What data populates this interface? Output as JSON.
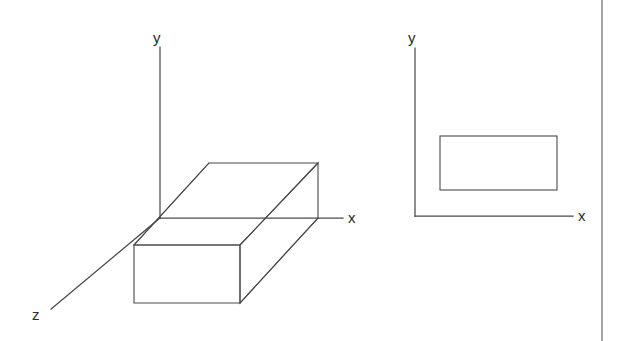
{
  "figure": {
    "background_color": "#ffffff",
    "line_color": "#4a4a4a",
    "label_color": "#2b2b2b",
    "width": 625,
    "height": 341
  },
  "left_diagram": {
    "name": "three-dimensional-box",
    "axes": [
      {
        "id": "y",
        "label": "y",
        "label_x": 153,
        "label_y": 43,
        "x1": 160,
        "y1": 47,
        "x2": 160,
        "y2": 218
      },
      {
        "id": "x",
        "label": "x",
        "label_x": 348,
        "label_y": 223,
        "x1": 160,
        "y1": 218,
        "x2": 343,
        "y2": 218
      },
      {
        "id": "z",
        "label": "z",
        "label_x": 32,
        "label_y": 320,
        "x1": 160,
        "y1": 218,
        "x2": 51,
        "y2": 309
      }
    ],
    "box": {
      "top_face": [
        [
          209,
          163
        ],
        [
          318,
          163
        ],
        [
          240,
          245
        ],
        [
          134,
          245
        ]
      ],
      "front_face": [
        [
          134,
          245
        ],
        [
          240,
          245
        ],
        [
          240,
          303
        ],
        [
          134,
          303
        ]
      ],
      "right_face": [
        [
          240,
          245
        ],
        [
          318,
          163
        ],
        [
          318,
          218
        ],
        [
          240,
          303
        ]
      ],
      "vertices": {
        "top_back_left": [
          209,
          163
        ],
        "top_back_right": [
          318,
          163
        ],
        "top_front_right": [
          240,
          245
        ],
        "top_front_left": [
          134,
          245
        ],
        "bottom_front_left": [
          134,
          303
        ],
        "bottom_front_right": [
          240,
          303
        ],
        "bottom_back_right": [
          318,
          218
        ]
      }
    }
  },
  "right_diagram": {
    "name": "two-dimensional-projection",
    "axes": [
      {
        "id": "y",
        "label": "y",
        "label_x": 408,
        "label_y": 43,
        "x1": 415,
        "y1": 48,
        "x2": 415,
        "y2": 216
      },
      {
        "id": "x",
        "label": "x",
        "label_x": 578,
        "label_y": 221,
        "x1": 415,
        "y1": 216,
        "x2": 573,
        "y2": 216
      }
    ],
    "rectangle": {
      "x": 440,
      "y": 136,
      "width": 117,
      "height": 54
    }
  },
  "border": {
    "name": "right-page-border",
    "x1": 602,
    "y1": 0,
    "x2": 602,
    "y2": 341
  }
}
